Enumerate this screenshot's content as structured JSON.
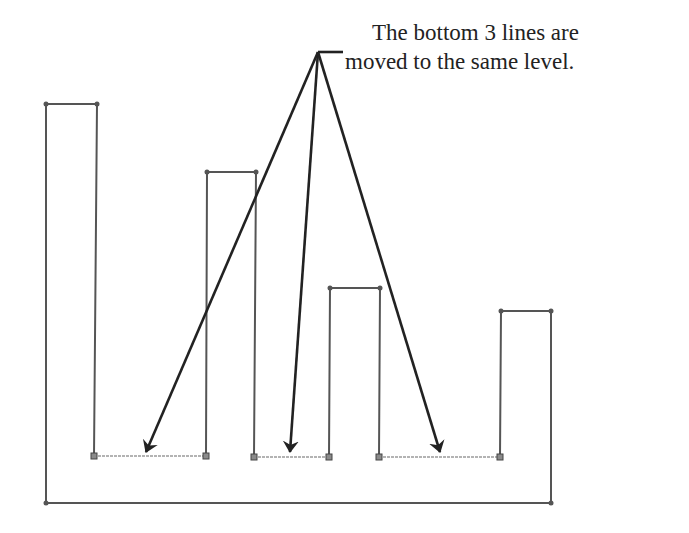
{
  "annotation": {
    "line1": "The bottom 3 lines are",
    "line2": "moved to the same level."
  },
  "colors": {
    "profile_line": "#555555",
    "moved_line": "#9a9a9a",
    "arrow": "#222222",
    "vertex_square": "#8a8a8a"
  },
  "profile": {
    "points": [
      [
        46,
        104
      ],
      [
        97,
        104
      ],
      [
        94,
        456
      ],
      [
        206,
        456
      ],
      [
        207,
        172
      ],
      [
        256,
        172
      ],
      [
        254,
        457
      ],
      [
        329,
        457
      ],
      [
        330,
        288
      ],
      [
        380,
        288
      ],
      [
        379,
        457
      ],
      [
        500,
        457
      ],
      [
        501,
        311
      ],
      [
        551,
        311
      ],
      [
        551,
        503
      ],
      [
        46,
        503
      ]
    ],
    "moved_segments": [
      {
        "from": [
          94,
          456
        ],
        "to": [
          206,
          456
        ]
      },
      {
        "from": [
          254,
          457
        ],
        "to": [
          329,
          457
        ]
      },
      {
        "from": [
          379,
          457
        ],
        "to": [
          500,
          457
        ]
      }
    ]
  },
  "arrows": {
    "origin": [
      318,
      52
    ],
    "leader_end": [
      343,
      52
    ],
    "tips": [
      [
        146,
        452
      ],
      [
        290,
        452
      ],
      [
        440,
        452
      ]
    ]
  }
}
